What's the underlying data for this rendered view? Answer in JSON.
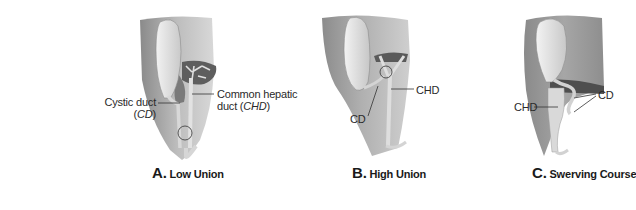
{
  "figure": {
    "panels": [
      {
        "id": "A",
        "letter": "A.",
        "caption": "Low Union",
        "labels": {
          "cystic_line1": "Cystic duct",
          "cystic_line2_pre": "(",
          "cystic_abbrev": "CD",
          "cystic_line2_post": ")",
          "chd_line1": "Common hepatic",
          "chd_line2_pre": "duct (",
          "chd_abbrev": "CHD",
          "chd_line2_post": ")"
        }
      },
      {
        "id": "B",
        "letter": "B.",
        "caption": "High Union",
        "labels": {
          "cd": "CD",
          "chd": "CHD"
        }
      },
      {
        "id": "C",
        "letter": "C.",
        "caption": "Swerving Course",
        "labels": {
          "cd": "CD",
          "chd": "CHD"
        }
      }
    ]
  },
  "colors": {
    "background": "#ffffff",
    "liver_dark": "#6f6f6f",
    "liver_mid": "#a8a8a8",
    "gallbladder": "#e6e6e6",
    "duct": "#dcdcdc",
    "text": "#222222"
  }
}
